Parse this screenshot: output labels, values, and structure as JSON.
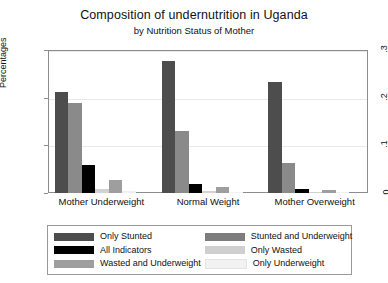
{
  "chart_data": {
    "type": "bar",
    "title": "Composition of undernutrition in Uganda",
    "subtitle": "by Nutrition Status of Mother",
    "xlabel": "",
    "ylabel": "Percentages",
    "categories": [
      "Mother Underweight",
      "Normal Weight",
      "Mother Overweight"
    ],
    "ylim": [
      0,
      0.3
    ],
    "yticks": [
      "0",
      ".1",
      ".2",
      ".3"
    ],
    "ytick_values": [
      0,
      0.1,
      0.2,
      0.3
    ],
    "grid": true,
    "legend_position": "bottom",
    "series": [
      {
        "name": "Only Stunted",
        "color": "#4d4d4d",
        "values": [
          0.211,
          0.278,
          0.233
        ]
      },
      {
        "name": "Stunted and Underweight",
        "color": "#8a8a8a",
        "values": [
          0.189,
          0.131,
          0.064
        ]
      },
      {
        "name": "All Indicators",
        "color": "#000000",
        "values": [
          0.058,
          0.019,
          0.008
        ]
      },
      {
        "name": "Only Wasted",
        "color": "#d2d2d2",
        "values": [
          0.008,
          0.004,
          0.002
        ]
      },
      {
        "name": "Wasted and Underweight",
        "color": "#9e9e9e",
        "values": [
          0.028,
          0.012,
          0.007
        ]
      },
      {
        "name": "Only Underweight",
        "color": "#f0f0f0",
        "values": [
          0.005,
          0.003,
          0.002
        ]
      }
    ],
    "legend_entries": [
      {
        "label": "Only Stunted",
        "color": "#4d4d4d"
      },
      {
        "label": "Stunted and Underweight",
        "color": "#7d7d7d"
      },
      {
        "label": "All Indicators",
        "color": "#000000"
      },
      {
        "label": "Only Wasted",
        "color": "#cfcfcf"
      },
      {
        "label": "Wasted and Underweight",
        "color": "#9e9e9e"
      },
      {
        "label": "Only Underweight",
        "color": "#f2f2f2"
      }
    ]
  }
}
